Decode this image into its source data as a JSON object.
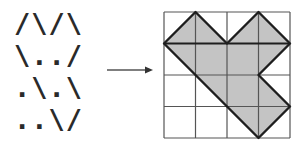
{
  "ascii_pattern": {
    "rows": [
      "/\\/\\",
      "\\../",
      ".\\.\\",
      "..\\/"
    ]
  },
  "arrow": {
    "direction": "right",
    "color": "#333333"
  },
  "grid": {
    "rows": 4,
    "cols": 4,
    "cell_size": 31.5,
    "line_color": "#555555",
    "fill_color": "#c4c4c4",
    "outline_color": "#1e1e1e",
    "shape_vertices": [
      [
        0,
        1
      ],
      [
        1,
        0
      ],
      [
        2,
        1
      ],
      [
        3,
        0
      ],
      [
        4,
        1
      ],
      [
        3,
        2
      ],
      [
        4,
        3
      ],
      [
        3,
        4
      ],
      [
        1,
        2
      ]
    ]
  }
}
